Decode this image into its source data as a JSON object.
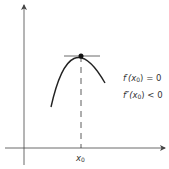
{
  "diagram": {
    "colors": {
      "stroke": "#222222",
      "axis": "#444444",
      "text": "#333333",
      "background": "#ffffff"
    },
    "axes": {
      "x_axis": {
        "y": 148,
        "x_start": 5,
        "x_end": 166,
        "arrow": "right"
      },
      "y_axis": {
        "x": 24,
        "y_start": 165,
        "y_end": 4,
        "arrow": "up"
      }
    },
    "curve": {
      "type": "concave-down parabola",
      "start": [
        51,
        107
      ],
      "peak": [
        81,
        56
      ],
      "end": [
        105,
        83
      ]
    },
    "tangent_line": {
      "x_start": 64,
      "x_end": 100,
      "y": 56
    },
    "critical_point": {
      "x": 81,
      "y": 56,
      "radius": 2.5
    },
    "dashed_drop_line": {
      "x": 81,
      "y_start": 56,
      "y_end": 148
    },
    "labels": {
      "x0_tick": "x",
      "x0_sub": "0",
      "first_derivative_fn": "f′(",
      "first_derivative_var": "x",
      "first_derivative_sub": "0",
      "first_derivative_rest": ") = 0",
      "second_derivative_fn": "f″(",
      "second_derivative_var": "x",
      "second_derivative_sub": "0",
      "second_derivative_rest": ") < 0"
    }
  }
}
